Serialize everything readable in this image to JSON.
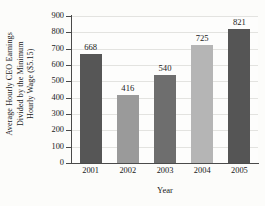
{
  "chart_data": {
    "type": "bar",
    "title": "",
    "categories": [
      "2001",
      "2002",
      "2003",
      "2004",
      "2005"
    ],
    "values": [
      668,
      416,
      540,
      725,
      821
    ],
    "data_labels": [
      "668",
      "416",
      "540",
      "725",
      "821"
    ],
    "xlabel": "Year",
    "ylabel_lines": [
      "Average Hourly CEO Earnings",
      "Divided by the Minimum",
      "Hourly Wage ($5.15)"
    ],
    "ylabel": "Average Hourly CEO Earnings Divided by the Minimum Hourly Wage ($5.15)",
    "ylim": [
      0,
      900
    ],
    "ytick_step": 100,
    "ytick_labels": [
      "900",
      "800",
      "700",
      "600",
      "500",
      "400",
      "300",
      "200",
      "100",
      "0"
    ],
    "ytick_values": [
      900,
      800,
      700,
      600,
      500,
      400,
      300,
      200,
      100,
      0
    ],
    "grid": true,
    "legend": false,
    "bar_colors": [
      "#565656",
      "#9a9a9a",
      "#6e6e6e",
      "#b5b5b5",
      "#555555"
    ],
    "axis_color": "#4a4a4a",
    "grid_color": "#e3e3e0",
    "background_color": "#fdfdfb"
  }
}
